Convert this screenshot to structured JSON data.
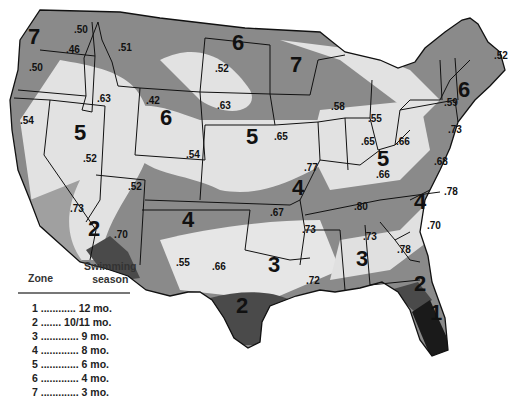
{
  "colors": {
    "zone1": "#1a1a1a",
    "zone2": "#4a4a4a",
    "dark_band": "#8a8a8a",
    "light_band": "#e0e0e0",
    "border": "#111111",
    "background": "#ffffff"
  },
  "legend": {
    "zone_header": "Zone",
    "season_header_line1": "Swimming",
    "season_header_line2": "season",
    "rows": [
      {
        "zone": "1",
        "dots": " ............ ",
        "season": "12 mo."
      },
      {
        "zone": "2",
        "dots": " ....... ",
        "season": "10/11 mo."
      },
      {
        "zone": "3",
        "dots": " ............. ",
        "season": "9 mo."
      },
      {
        "zone": "4",
        "dots": " ............. ",
        "season": "8 mo."
      },
      {
        "zone": "5",
        "dots": " ............. ",
        "season": "6 mo."
      },
      {
        "zone": "6",
        "dots": " ............. ",
        "season": "4 mo."
      },
      {
        "zone": "7",
        "dots": " ............. ",
        "season": "3 mo."
      }
    ]
  },
  "zone_labels": [
    {
      "id": "wa",
      "text": "7"
    },
    {
      "id": "nd",
      "text": "6"
    },
    {
      "id": "mn",
      "text": "7"
    },
    {
      "id": "wy",
      "text": "6"
    },
    {
      "id": "ny",
      "text": "6"
    },
    {
      "id": "nv",
      "text": "5"
    },
    {
      "id": "ne",
      "text": "5"
    },
    {
      "id": "oh",
      "text": "5"
    },
    {
      "id": "mo",
      "text": "4"
    },
    {
      "id": "nm",
      "text": "4"
    },
    {
      "id": "nc",
      "text": "4"
    },
    {
      "id": "az",
      "text": "2"
    },
    {
      "id": "tx",
      "text": "3"
    },
    {
      "id": "ms",
      "text": "3"
    },
    {
      "id": "stx",
      "text": "2"
    },
    {
      "id": "nfl",
      "text": "2"
    },
    {
      "id": "sfl",
      "text": "1"
    }
  ],
  "values": [
    {
      "id": "wa1",
      "text": ".50"
    },
    {
      "id": "wa2",
      "text": ".46"
    },
    {
      "id": "or",
      "text": ".50"
    },
    {
      "id": "mt",
      "text": ".51"
    },
    {
      "id": "nd",
      "text": ".52"
    },
    {
      "id": "me",
      "text": ".52"
    },
    {
      "id": "id",
      "text": ".63"
    },
    {
      "id": "wy",
      "text": ".42"
    },
    {
      "id": "sd",
      "text": ".63"
    },
    {
      "id": "wi",
      "text": ".58"
    },
    {
      "id": "ny",
      "text": ".59"
    },
    {
      "id": "ca",
      "text": ".54"
    },
    {
      "id": "mi",
      "text": ".55"
    },
    {
      "id": "ia",
      "text": ".65"
    },
    {
      "id": "in",
      "text": ".65"
    },
    {
      "id": "oh",
      "text": ".66"
    },
    {
      "id": "pa",
      "text": ".73"
    },
    {
      "id": "nv",
      "text": ".52"
    },
    {
      "id": "co",
      "text": ".54"
    },
    {
      "id": "va",
      "text": ".68"
    },
    {
      "id": "mo",
      "text": ".77"
    },
    {
      "id": "ky",
      "text": ".66"
    },
    {
      "id": "ut",
      "text": ".52"
    },
    {
      "id": "nc",
      "text": ".78"
    },
    {
      "id": "sca",
      "text": ".73"
    },
    {
      "id": "ok",
      "text": ".67"
    },
    {
      "id": "tn",
      "text": ".80"
    },
    {
      "id": "azv",
      "text": ".70"
    },
    {
      "id": "sc",
      "text": ".70"
    },
    {
      "id": "ar",
      "text": ".73"
    },
    {
      "id": "al",
      "text": ".73"
    },
    {
      "id": "ga",
      "text": ".78"
    },
    {
      "id": "nmv",
      "text": ".55"
    },
    {
      "id": "txv",
      "text": ".66"
    },
    {
      "id": "la",
      "text": ".72"
    }
  ]
}
